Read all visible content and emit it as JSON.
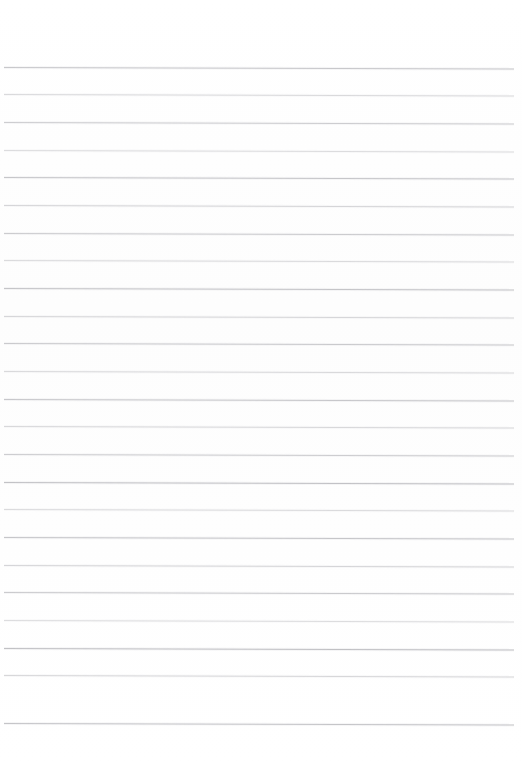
{
  "page": {
    "kind": "lined-paper-sheet",
    "width": 522,
    "height": 768,
    "background_color": "#ffffff",
    "paper_tone_color": "#fdfdfd",
    "has_visible_text": false,
    "has_margin_rule": false,
    "orientation": "portrait"
  },
  "ruling": {
    "line_color": "#b9b9bd",
    "line_count": 24,
    "line_thickness_px": 1,
    "first_line_y": 67,
    "line_spacing_px": 27.4,
    "left_inset_px": 4,
    "right_inset_px": 8,
    "top_margin_px": 67,
    "bottom_margin_px": 45,
    "tilt_deg": 0.16,
    "style": "wide-ruled-horizontal",
    "lines": [
      {
        "index": 1,
        "y": 67,
        "opacity": 0.78
      },
      {
        "index": 2,
        "y": 94,
        "opacity": 0.52
      },
      {
        "index": 3,
        "y": 122,
        "opacity": 0.7
      },
      {
        "index": 4,
        "y": 150,
        "opacity": 0.48
      },
      {
        "index": 5,
        "y": 177,
        "opacity": 0.8
      },
      {
        "index": 6,
        "y": 205,
        "opacity": 0.58
      },
      {
        "index": 7,
        "y": 233,
        "opacity": 0.72
      },
      {
        "index": 8,
        "y": 260,
        "opacity": 0.5
      },
      {
        "index": 9,
        "y": 288,
        "opacity": 0.82
      },
      {
        "index": 10,
        "y": 316,
        "opacity": 0.56
      },
      {
        "index": 11,
        "y": 343,
        "opacity": 0.74
      },
      {
        "index": 12,
        "y": 371,
        "opacity": 0.52
      },
      {
        "index": 13,
        "y": 399,
        "opacity": 0.78
      },
      {
        "index": 14,
        "y": 426,
        "opacity": 0.54
      },
      {
        "index": 15,
        "y": 454,
        "opacity": 0.7
      },
      {
        "index": 16,
        "y": 482,
        "opacity": 0.86
      },
      {
        "index": 17,
        "y": 509,
        "opacity": 0.5
      },
      {
        "index": 18,
        "y": 537,
        "opacity": 0.8
      },
      {
        "index": 19,
        "y": 565,
        "opacity": 0.58
      },
      {
        "index": 20,
        "y": 592,
        "opacity": 0.74
      },
      {
        "index": 21,
        "y": 620,
        "opacity": 0.48
      },
      {
        "index": 22,
        "y": 648,
        "opacity": 0.88
      },
      {
        "index": 23,
        "y": 675,
        "opacity": 0.56
      },
      {
        "index": 24,
        "y": 723,
        "opacity": 0.82
      }
    ]
  },
  "content": {
    "written_lines": []
  }
}
